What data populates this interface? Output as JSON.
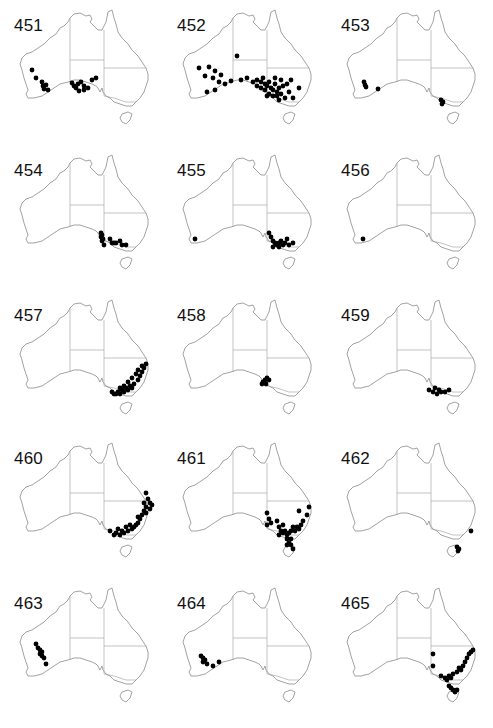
{
  "figure": {
    "dot_color": "#000000",
    "outline_color": "#8a8a8a"
  },
  "chart_data": {
    "type": "scatter",
    "title": "",
    "layout": {
      "rows": 5,
      "cols": 3,
      "grid": false,
      "legend": "none"
    },
    "panels": [
      {
        "label": "451",
        "region": "south-western WA and South Australia",
        "points": [
          [
            26,
            62
          ],
          [
            30,
            70
          ],
          [
            36,
            74
          ],
          [
            37,
            78
          ],
          [
            40,
            77
          ],
          [
            38,
            81
          ],
          [
            42,
            82
          ],
          [
            66,
            75
          ],
          [
            68,
            78
          ],
          [
            70,
            80
          ],
          [
            72,
            76
          ],
          [
            75,
            74
          ],
          [
            78,
            78
          ],
          [
            78,
            82
          ],
          [
            82,
            80
          ],
          [
            86,
            72
          ],
          [
            90,
            70
          ],
          [
            73,
            83
          ]
        ]
      },
      {
        "label": "452",
        "region": "southern Australia, widespread; concentrated in SA/NSW/VIC",
        "points": [
          [
            68,
            48
          ],
          [
            30,
            60
          ],
          [
            40,
            59
          ],
          [
            46,
            63
          ],
          [
            52,
            67
          ],
          [
            36,
            68
          ],
          [
            44,
            70
          ],
          [
            50,
            74
          ],
          [
            56,
            76
          ],
          [
            62,
            73
          ],
          [
            72,
            72
          ],
          [
            38,
            84
          ],
          [
            46,
            82
          ],
          [
            78,
            70
          ],
          [
            84,
            74
          ],
          [
            88,
            72
          ],
          [
            92,
            74
          ],
          [
            94,
            70
          ],
          [
            96,
            76
          ],
          [
            98,
            78
          ],
          [
            100,
            74
          ],
          [
            102,
            80
          ],
          [
            104,
            82
          ],
          [
            106,
            76
          ],
          [
            108,
            84
          ],
          [
            110,
            80
          ],
          [
            112,
            86
          ],
          [
            100,
            86
          ],
          [
            96,
            82
          ],
          [
            114,
            78
          ],
          [
            118,
            76
          ],
          [
            120,
            84
          ],
          [
            116,
            90
          ],
          [
            124,
            90
          ],
          [
            110,
            92
          ],
          [
            130,
            80
          ],
          [
            122,
            72
          ],
          [
            106,
            70
          ],
          [
            112,
            72
          ],
          [
            92,
            80
          ],
          [
            88,
            78
          ],
          [
            98,
            88
          ],
          [
            104,
            88
          ],
          [
            108,
            88
          ]
        ]
      },
      {
        "label": "453",
        "region": "south-western WA and Victoria",
        "points": [
          [
            31,
            74
          ],
          [
            32,
            77
          ],
          [
            33,
            79
          ],
          [
            45,
            81
          ],
          [
            108,
            92
          ],
          [
            110,
            94
          ],
          [
            109,
            96
          ]
        ]
      },
      {
        "label": "454",
        "region": "South Australia and western Victoria",
        "points": [
          [
            95,
            80
          ],
          [
            96,
            82
          ],
          [
            95,
            84
          ],
          [
            97,
            86
          ],
          [
            96,
            88
          ],
          [
            104,
            86
          ],
          [
            106,
            90
          ],
          [
            108,
            90
          ],
          [
            110,
            90
          ],
          [
            114,
            88
          ],
          [
            116,
            92
          ],
          [
            120,
            92
          ],
          [
            98,
            92
          ]
        ]
      },
      {
        "label": "455",
        "region": "south-western WA, SA-VIC border region",
        "points": [
          [
            26,
            86
          ],
          [
            100,
            80
          ],
          [
            102,
            84
          ],
          [
            104,
            88
          ],
          [
            106,
            90
          ],
          [
            108,
            92
          ],
          [
            110,
            90
          ],
          [
            112,
            88
          ],
          [
            114,
            92
          ],
          [
            116,
            90
          ],
          [
            118,
            86
          ],
          [
            110,
            94
          ],
          [
            104,
            94
          ],
          [
            120,
            92
          ],
          [
            124,
            90
          ]
        ]
      },
      {
        "label": "456",
        "region": "south-western WA",
        "points": [
          [
            30,
            86
          ]
        ]
      },
      {
        "label": "457",
        "region": "New South Wales, Victoria, south-eastern Queensland",
        "points": [
          [
            140,
            66
          ],
          [
            138,
            70
          ],
          [
            136,
            74
          ],
          [
            134,
            78
          ],
          [
            132,
            82
          ],
          [
            128,
            86
          ],
          [
            126,
            90
          ],
          [
            122,
            92
          ],
          [
            118,
            94
          ],
          [
            114,
            96
          ],
          [
            110,
            96
          ],
          [
            130,
            76
          ],
          [
            126,
            80
          ],
          [
            122,
            84
          ],
          [
            118,
            88
          ],
          [
            114,
            90
          ],
          [
            112,
            94
          ],
          [
            108,
            96
          ],
          [
            106,
            94
          ],
          [
            132,
            72
          ],
          [
            136,
            68
          ],
          [
            124,
            88
          ],
          [
            120,
            90
          ],
          [
            116,
            92
          ]
        ]
      },
      {
        "label": "458",
        "region": "south-eastern South Australia",
        "points": [
          [
            94,
            84
          ],
          [
            96,
            82
          ],
          [
            98,
            80
          ],
          [
            100,
            82
          ],
          [
            97,
            86
          ],
          [
            93,
            86
          ]
        ]
      },
      {
        "label": "459",
        "region": "southern Victoria",
        "points": [
          [
            96,
            92
          ],
          [
            100,
            94
          ],
          [
            104,
            96
          ],
          [
            108,
            94
          ],
          [
            112,
            94
          ],
          [
            116,
            92
          ],
          [
            102,
            90
          ],
          [
            106,
            92
          ]
        ]
      },
      {
        "label": "460",
        "region": "eastern coast: Queensland, New South Wales, Victoria",
        "points": [
          [
            140,
            52
          ],
          [
            142,
            58
          ],
          [
            144,
            62
          ],
          [
            146,
            64
          ],
          [
            140,
            66
          ],
          [
            138,
            70
          ],
          [
            136,
            74
          ],
          [
            134,
            78
          ],
          [
            132,
            82
          ],
          [
            130,
            84
          ],
          [
            128,
            86
          ],
          [
            126,
            88
          ],
          [
            122,
            90
          ],
          [
            118,
            92
          ],
          [
            114,
            94
          ],
          [
            108,
            94
          ],
          [
            104,
            90
          ],
          [
            110,
            92
          ],
          [
            116,
            90
          ],
          [
            138,
            62
          ],
          [
            132,
            76
          ],
          [
            120,
            86
          ],
          [
            124,
            84
          ],
          [
            112,
            88
          ],
          [
            144,
            68
          ],
          [
            140,
            72
          ]
        ]
      },
      {
        "label": "461",
        "region": "Victoria, NSW, SA, Tasmania",
        "points": [
          [
            98,
            72
          ],
          [
            100,
            78
          ],
          [
            98,
            84
          ],
          [
            102,
            82
          ],
          [
            108,
            80
          ],
          [
            110,
            86
          ],
          [
            112,
            90
          ],
          [
            114,
            92
          ],
          [
            116,
            90
          ],
          [
            118,
            94
          ],
          [
            120,
            92
          ],
          [
            122,
            90
          ],
          [
            124,
            86
          ],
          [
            126,
            90
          ],
          [
            128,
            86
          ],
          [
            130,
            88
          ],
          [
            132,
            84
          ],
          [
            134,
            80
          ],
          [
            138,
            74
          ],
          [
            140,
            66
          ],
          [
            130,
            70
          ],
          [
            114,
            84
          ],
          [
            110,
            94
          ],
          [
            118,
            98
          ],
          [
            120,
            102
          ],
          [
            122,
            104
          ],
          [
            124,
            108
          ],
          [
            118,
            104
          ],
          [
            122,
            98
          ]
        ]
      },
      {
        "label": "462",
        "region": "Tasmania and south-eastern NSW",
        "points": [
          [
            138,
            90
          ],
          [
            124,
            106
          ],
          [
            126,
            108
          ],
          [
            125,
            110
          ]
        ]
      },
      {
        "label": "463",
        "region": "south-western WA",
        "points": [
          [
            30,
            58
          ],
          [
            32,
            62
          ],
          [
            34,
            64
          ],
          [
            36,
            66
          ],
          [
            34,
            68
          ],
          [
            36,
            70
          ],
          [
            38,
            72
          ],
          [
            40,
            78
          ]
        ]
      },
      {
        "label": "464",
        "region": "south-western WA",
        "points": [
          [
            32,
            70
          ],
          [
            34,
            72
          ],
          [
            36,
            74
          ],
          [
            34,
            76
          ],
          [
            38,
            78
          ],
          [
            44,
            80
          ],
          [
            50,
            76
          ]
        ]
      },
      {
        "label": "465",
        "region": "eastern NSW, Victoria, Tasmania, SA",
        "points": [
          [
            100,
            68
          ],
          [
            100,
            80
          ],
          [
            108,
            90
          ],
          [
            112,
            92
          ],
          [
            116,
            90
          ],
          [
            120,
            88
          ],
          [
            124,
            86
          ],
          [
            128,
            84
          ],
          [
            130,
            80
          ],
          [
            132,
            76
          ],
          [
            134,
            72
          ],
          [
            136,
            68
          ],
          [
            138,
            66
          ],
          [
            140,
            64
          ],
          [
            126,
            82
          ],
          [
            118,
            92
          ],
          [
            114,
            94
          ],
          [
            118,
            102
          ],
          [
            120,
            104
          ],
          [
            122,
            106
          ],
          [
            124,
            104
          ],
          [
            116,
            100
          ]
        ]
      }
    ]
  }
}
